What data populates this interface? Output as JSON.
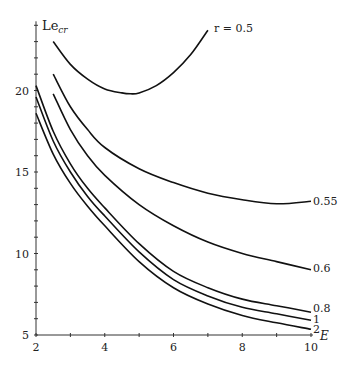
{
  "chart_data": {
    "type": "line",
    "title": "",
    "xlabel": "E",
    "ylabel": "Le_cr",
    "xlim": [
      2,
      10
    ],
    "ylim": [
      5,
      24
    ],
    "xticks": [
      2,
      4,
      6,
      8,
      10
    ],
    "yticks": [
      5,
      10,
      15,
      20
    ],
    "grid": false,
    "series": [
      {
        "name": "r = 0.5",
        "label": "r = 0.5",
        "x": [
          2.5,
          3,
          3.5,
          4,
          4.5,
          4.75,
          5,
          5.5,
          6,
          6.5,
          7
        ],
        "y": [
          23.0,
          21.6,
          20.7,
          20.1,
          19.85,
          19.8,
          19.85,
          20.3,
          21.1,
          22.2,
          23.7
        ]
      },
      {
        "name": "0.55",
        "label": "0.55",
        "x": [
          2.5,
          3,
          3.5,
          4,
          5,
          6,
          7,
          8,
          9,
          10
        ],
        "y": [
          21.0,
          19.0,
          17.6,
          16.5,
          15.2,
          14.35,
          13.7,
          13.3,
          13.05,
          13.2
        ]
      },
      {
        "name": "0.6",
        "label": "0.6",
        "x": [
          2.5,
          3,
          3.5,
          4,
          5,
          6,
          7,
          8,
          9,
          10
        ],
        "y": [
          19.8,
          17.6,
          16.0,
          14.8,
          13.0,
          11.7,
          10.7,
          10.0,
          9.5,
          9.0
        ]
      },
      {
        "name": "0.8",
        "label": "0.8",
        "x": [
          2,
          2.5,
          3,
          3.5,
          4,
          5,
          6,
          7,
          8,
          9,
          10
        ],
        "y": [
          20.3,
          17.5,
          15.5,
          14.0,
          12.8,
          10.6,
          8.9,
          7.9,
          7.2,
          6.8,
          6.4
        ]
      },
      {
        "name": "1",
        "label": "1",
        "x": [
          2,
          2.5,
          3,
          3.5,
          4,
          5,
          6,
          7,
          8,
          9,
          10
        ],
        "y": [
          19.6,
          16.9,
          15.0,
          13.5,
          12.3,
          10.1,
          8.4,
          7.4,
          6.7,
          6.3,
          5.9
        ]
      },
      {
        "name": "2",
        "label": "2",
        "x": [
          2,
          2.5,
          3,
          3.5,
          4,
          5,
          6,
          7,
          8,
          9,
          10
        ],
        "y": [
          18.6,
          16.1,
          14.3,
          12.9,
          11.7,
          9.5,
          7.9,
          6.9,
          6.2,
          5.75,
          5.35
        ]
      }
    ]
  },
  "axes": {
    "x_label": "E",
    "y_label_main": "Le",
    "y_label_sub": "cr",
    "x_tick_labels": [
      "2",
      "4",
      "6",
      "8",
      "10"
    ],
    "y_tick_labels": [
      "5",
      "10",
      "15",
      "20"
    ]
  },
  "labels": {
    "r05": "r = 0.5",
    "r055": "0.55",
    "r06": "0.6",
    "r08": "0.8",
    "r1": "1",
    "r2": "2"
  }
}
